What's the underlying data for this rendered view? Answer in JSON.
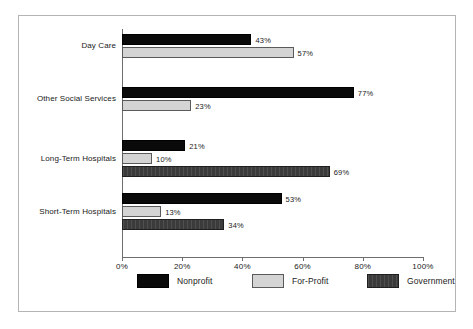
{
  "chart_data": {
    "type": "bar",
    "orientation": "horizontal",
    "title": "",
    "xlabel": "",
    "ylabel": "",
    "xlim": [
      0,
      100
    ],
    "xticks": [
      "0%",
      "20%",
      "40%",
      "60%",
      "80%",
      "100%"
    ],
    "xtick_values": [
      0,
      20,
      40,
      60,
      80,
      100
    ],
    "grid": false,
    "legend_position": "bottom",
    "categories": [
      "Day Care",
      "Other Social Services",
      "Long-Term Hospitals",
      "Short-Term Hospitals"
    ],
    "series": [
      {
        "name": "Nonprofit",
        "color": "#0a0a0a",
        "values": [
          43,
          77,
          21,
          53
        ]
      },
      {
        "name": "For-Profit",
        "color": "#d4d4d4",
        "values": [
          57,
          23,
          10,
          13
        ]
      },
      {
        "name": "Government",
        "color": "#3b3b3b",
        "values": [
          null,
          null,
          69,
          34
        ]
      }
    ],
    "data_labels": {
      "Day Care": {
        "Nonprofit": "43%",
        "For-Profit": "57%",
        "Government": ""
      },
      "Other Social Services": {
        "Nonprofit": "77%",
        "For-Profit": "23%",
        "Government": ""
      },
      "Long-Term Hospitals": {
        "Nonprofit": "21%",
        "For-Profit": "10%",
        "Government": "69%"
      },
      "Short-Term Hospitals": {
        "Nonprofit": "53%",
        "For-Profit": "13%",
        "Government": "34%"
      }
    }
  },
  "legend": {
    "items": [
      {
        "label": "Nonprofit"
      },
      {
        "label": "For-Profit"
      },
      {
        "label": "Government"
      }
    ]
  },
  "axis": {
    "ticks": [
      {
        "label": "0%"
      },
      {
        "label": "20%"
      },
      {
        "label": "40%"
      },
      {
        "label": "60%"
      },
      {
        "label": "80%"
      },
      {
        "label": "100%"
      }
    ]
  }
}
